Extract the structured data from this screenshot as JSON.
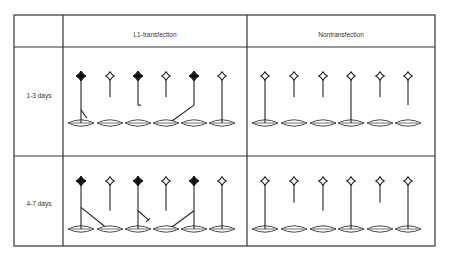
{
  "table": {
    "corner_label": "",
    "columns": [
      {
        "id": "l1",
        "label": "L1-transfection"
      },
      {
        "id": "non",
        "label": "Nontransfection"
      }
    ],
    "rows": [
      {
        "id": "r1",
        "label": "1-3 days"
      },
      {
        "id": "r2",
        "label": "4-7 days"
      }
    ]
  },
  "legend_semantics": {
    "filled_soma": "L1-transfected neuron",
    "open_soma": "non-transfected neuron",
    "stem": "axon",
    "lens": "target cell"
  },
  "cells": {
    "r1_l1": [
      {
        "soma": "filled",
        "axon": "full",
        "branch": "left-down"
      },
      {
        "soma": "open",
        "axon": "short"
      },
      {
        "soma": "filled",
        "axon": "mid",
        "branch": "hook"
      },
      {
        "soma": "open",
        "axon": "short"
      },
      {
        "soma": "filled",
        "axon": "mid",
        "branch": "long-left"
      },
      {
        "soma": "open",
        "axon": "full"
      }
    ],
    "r1_non": [
      {
        "soma": "open",
        "axon": "full"
      },
      {
        "soma": "open",
        "axon": "short"
      },
      {
        "soma": "open",
        "axon": "short"
      },
      {
        "soma": "open",
        "axon": "full"
      },
      {
        "soma": "open",
        "axon": "short"
      },
      {
        "soma": "open",
        "axon": "mid"
      }
    ],
    "r2_l1": [
      {
        "soma": "filled",
        "axon": "full",
        "branch": "long-right"
      },
      {
        "soma": "open",
        "axon": "mid"
      },
      {
        "soma": "filled",
        "axon": "full",
        "branch": "arrow-right"
      },
      {
        "soma": "open",
        "axon": "mid"
      },
      {
        "soma": "filled",
        "axon": "full",
        "branch": "long-left"
      },
      {
        "soma": "open",
        "axon": "full"
      }
    ],
    "r2_non": [
      {
        "soma": "open",
        "axon": "full"
      },
      {
        "soma": "open",
        "axon": "short"
      },
      {
        "soma": "open",
        "axon": "mid"
      },
      {
        "soma": "open",
        "axon": "full"
      },
      {
        "soma": "open",
        "axon": "short"
      },
      {
        "soma": "open",
        "axon": "full"
      }
    ]
  }
}
